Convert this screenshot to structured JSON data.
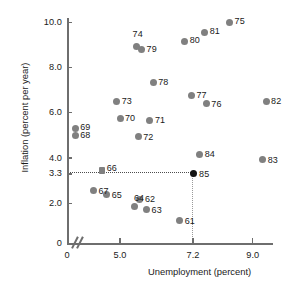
{
  "chart_data": {
    "type": "scatter",
    "title": "",
    "xlabel": "Unemployment (percent)",
    "ylabel": "Inflation (percent per year)",
    "xlim": [
      4.0,
      10.0
    ],
    "ylim": [
      0.5,
      10.8
    ],
    "xticks": [
      "0",
      "5.0",
      "7.2",
      "9.0"
    ],
    "yticks": [
      "10.0",
      "8.0",
      "6.0",
      "4.0",
      "3.3",
      "2.0",
      "0"
    ],
    "grid": false,
    "legend": null,
    "axis_break": true,
    "reference_lines": {
      "horizontal_value": 3.3,
      "vertical_value": 7.2,
      "style": "dotted"
    },
    "highlighted_point": "85",
    "points": [
      {
        "label": "61",
        "x": 6.8,
        "y": 1.25
      },
      {
        "label": "62",
        "x": 5.6,
        "y": 2.15
      },
      {
        "label": "63",
        "x": 5.8,
        "y": 1.7
      },
      {
        "label": "64",
        "x": 5.45,
        "y": 1.85
      },
      {
        "label": "65",
        "x": 4.6,
        "y": 2.4
      },
      {
        "label": "66",
        "x": 4.45,
        "y": 3.45,
        "marker": "square"
      },
      {
        "label": "67",
        "x": 4.2,
        "y": 2.55
      },
      {
        "label": "68",
        "x": 3.65,
        "y": 5.0
      },
      {
        "label": "69",
        "x": 3.65,
        "y": 5.3
      },
      {
        "label": "70",
        "x": 5.0,
        "y": 5.75
      },
      {
        "label": "71",
        "x": 5.9,
        "y": 5.65
      },
      {
        "label": "72",
        "x": 5.55,
        "y": 4.95
      },
      {
        "label": "73",
        "x": 4.9,
        "y": 6.5
      },
      {
        "label": "74",
        "x": 5.5,
        "y": 8.95
      },
      {
        "label": "75",
        "x": 8.3,
        "y": 10.0
      },
      {
        "label": "76",
        "x": 7.6,
        "y": 6.4
      },
      {
        "label": "77",
        "x": 7.15,
        "y": 6.75
      },
      {
        "label": "78",
        "x": 6.0,
        "y": 7.35
      },
      {
        "label": "79",
        "x": 5.65,
        "y": 8.8
      },
      {
        "label": "80",
        "x": 6.95,
        "y": 9.15
      },
      {
        "label": "81",
        "x": 7.55,
        "y": 9.55
      },
      {
        "label": "82",
        "x": 9.4,
        "y": 6.5
      },
      {
        "label": "83",
        "x": 9.3,
        "y": 3.95
      },
      {
        "label": "84",
        "x": 7.4,
        "y": 4.15
      },
      {
        "label": "85",
        "x": 7.2,
        "y": 3.3,
        "highlighted": true
      }
    ]
  },
  "colors": {
    "marker": "#808080",
    "marker_highlight": "#141414",
    "axis": "#6e6e6e",
    "text": "#1a1a1a",
    "guide": "#4d4d4d",
    "background": "#ffffff"
  }
}
